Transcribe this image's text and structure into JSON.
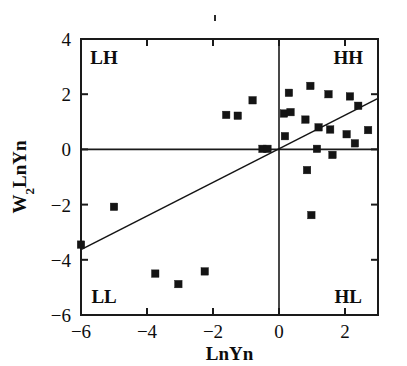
{
  "chart_data": {
    "type": "scatter",
    "title": "",
    "xlabel": "LnYn",
    "ylabel": "W2LnYn",
    "ylabel_base": "W",
    "ylabel_sub": "2",
    "ylabel_rest": "LnYn",
    "xlim": [
      -6,
      3
    ],
    "ylim": [
      -6,
      4
    ],
    "xticks": [
      -6,
      -4,
      -2,
      0,
      2
    ],
    "xticklabels": [
      "-6",
      "-4",
      "-2",
      "0",
      "2"
    ],
    "yticks": [
      -6,
      -4,
      -2,
      0,
      2,
      4
    ],
    "yticklabels": [
      "-6",
      "-4",
      "-2",
      "0",
      "2",
      "4"
    ],
    "grid": false,
    "legend": null,
    "quadrant_labels": [
      {
        "name": "LH",
        "text": "LH",
        "x": -5.3,
        "y": 3.35
      },
      {
        "name": "HH",
        "text": "HH",
        "x": 2.1,
        "y": 3.35
      },
      {
        "name": "LL",
        "text": "LL",
        "x": -5.3,
        "y": -5.3
      },
      {
        "name": "HL",
        "text": "HL",
        "x": 2.1,
        "y": -5.3
      }
    ],
    "zero_lines": {
      "x": 0,
      "y": 0
    },
    "trendline": {
      "name": "regression-line",
      "x1": -6.0,
      "y1": -3.63,
      "x2": 3.0,
      "y2": 1.85,
      "slope": 0.609,
      "intercept": 0.02
    },
    "marker_style": "filled-square",
    "marker_color": "#141414",
    "points": [
      {
        "x": -6.0,
        "y": -3.45
      },
      {
        "x": -5.0,
        "y": -2.08
      },
      {
        "x": -3.75,
        "y": -4.5
      },
      {
        "x": -3.05,
        "y": -4.88
      },
      {
        "x": -2.25,
        "y": -4.42
      },
      {
        "x": -1.6,
        "y": 1.25
      },
      {
        "x": -1.25,
        "y": 1.22
      },
      {
        "x": -0.8,
        "y": 1.78
      },
      {
        "x": -0.5,
        "y": 0.02
      },
      {
        "x": -0.35,
        "y": 0.02
      },
      {
        "x": 0.15,
        "y": 1.3
      },
      {
        "x": 0.18,
        "y": 0.48
      },
      {
        "x": 0.3,
        "y": 2.05
      },
      {
        "x": 0.35,
        "y": 1.35
      },
      {
        "x": 0.8,
        "y": 1.08
      },
      {
        "x": 0.85,
        "y": -0.75
      },
      {
        "x": 0.95,
        "y": 2.3
      },
      {
        "x": 0.98,
        "y": -2.38
      },
      {
        "x": 1.15,
        "y": 0.02
      },
      {
        "x": 1.2,
        "y": 0.8
      },
      {
        "x": 1.5,
        "y": 2.0
      },
      {
        "x": 1.55,
        "y": 0.72
      },
      {
        "x": 1.62,
        "y": -0.2
      },
      {
        "x": 2.05,
        "y": 0.55
      },
      {
        "x": 2.15,
        "y": 1.92
      },
      {
        "x": 2.3,
        "y": 0.22
      },
      {
        "x": 2.4,
        "y": 1.58
      },
      {
        "x": 2.7,
        "y": 0.7
      }
    ]
  },
  "artifacts": {
    "speck_label": "scan-speck"
  }
}
